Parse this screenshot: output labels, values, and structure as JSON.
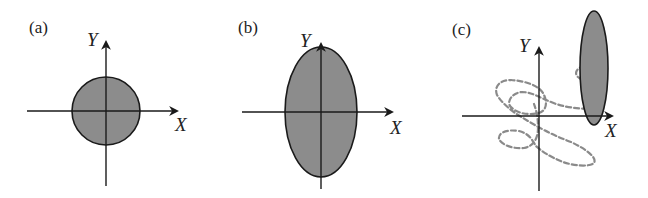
{
  "figure": {
    "panels": [
      {
        "id": "a",
        "label": "(a)",
        "x_axis_label": "X",
        "y_axis_label": "Y",
        "shape": "circle"
      },
      {
        "id": "b",
        "label": "(b)",
        "x_axis_label": "X",
        "y_axis_label": "Y",
        "shape": "vertical-ellipse"
      },
      {
        "id": "c",
        "label": "(c)",
        "x_axis_label": "X",
        "y_axis_label": "Y",
        "shape": "narrow-ellipse-with-dashed-trajectory"
      }
    ],
    "colors": {
      "fill": "#8c8c8c",
      "stroke": "#1a1a1a",
      "dashed_path": "#8a8a8a",
      "background": "#ffffff"
    }
  }
}
